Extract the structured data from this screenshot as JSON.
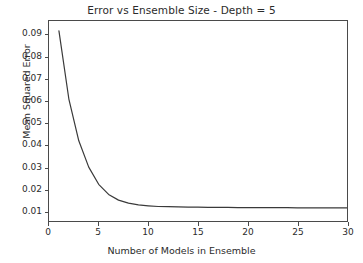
{
  "chart_data": {
    "type": "line",
    "title": "Error vs Ensemble Size - Depth = 5",
    "xlabel": "Number of Models in Ensemble",
    "ylabel": "Mean Squared Error",
    "xlim": [
      0,
      30
    ],
    "ylim": [
      0.0055,
      0.0965
    ],
    "grid": false,
    "legend": null,
    "xticks": [
      0,
      5,
      10,
      15,
      20,
      25,
      30
    ],
    "xticklabels": [
      "0",
      "5",
      "10",
      "15",
      "20",
      "25",
      "30"
    ],
    "yticks": [
      0.01,
      0.02,
      0.03,
      0.04,
      0.05,
      0.06,
      0.07,
      0.08,
      0.09
    ],
    "yticklabels": [
      "0.01",
      "0.02",
      "0.03",
      "0.04",
      "0.05",
      "0.06",
      "0.07",
      "0.08",
      "0.09"
    ],
    "line_color": "#3a3a3a",
    "line_width": 1.2,
    "series": [
      {
        "name": "Mean Squared Error",
        "x": [
          1,
          2,
          3,
          4,
          5,
          6,
          7,
          8,
          9,
          10,
          11,
          12,
          13,
          14,
          15,
          16,
          17,
          18,
          19,
          20,
          21,
          22,
          23,
          24,
          25,
          26,
          27,
          28,
          29,
          30
        ],
        "values": [
          0.092,
          0.061,
          0.042,
          0.03,
          0.0222,
          0.0176,
          0.015,
          0.0136,
          0.0128,
          0.0124,
          0.0121,
          0.012,
          0.0119,
          0.0118,
          0.0118,
          0.0117,
          0.0117,
          0.0117,
          0.0116,
          0.0116,
          0.0116,
          0.0116,
          0.0116,
          0.0116,
          0.0115,
          0.0115,
          0.0115,
          0.0115,
          0.0115,
          0.0115
        ]
      }
    ]
  }
}
